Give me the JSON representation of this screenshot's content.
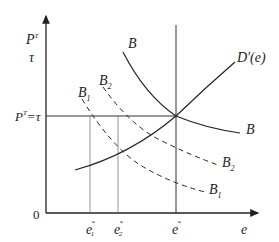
{
  "diagram": {
    "type": "economics-curve-diagram",
    "y_axis": {
      "label_top": "P",
      "label_top_sup": "T",
      "label_bottom": "τ"
    },
    "x_axis": {
      "label": "e",
      "origin": "0"
    },
    "horizontal_line_label": {
      "base": "P",
      "sup": "T",
      "rest": "=τ"
    },
    "curves": [
      {
        "id": "B",
        "label": "B",
        "label_right": "B",
        "style": "solid",
        "shape": "convex-decreasing"
      },
      {
        "id": "D",
        "label": "D'(e)",
        "style": "solid",
        "shape": "increasing"
      },
      {
        "id": "B2",
        "label": "B",
        "sub": "2",
        "style": "dashed"
      },
      {
        "id": "B1",
        "label": "B",
        "sub": "1",
        "style": "dashed"
      }
    ],
    "x_ticks": [
      {
        "base": "e",
        "sub": "1",
        "sup": "*"
      },
      {
        "base": "e",
        "sub": "2",
        "sup": "*"
      },
      {
        "base": "e",
        "sub": "",
        "sup": "*"
      }
    ],
    "colors": {
      "line": "#222222",
      "guide": "#555555"
    }
  }
}
